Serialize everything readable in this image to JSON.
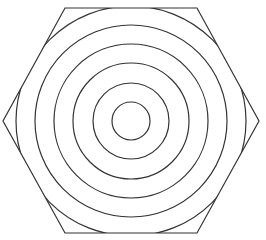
{
  "figure": {
    "width": 266,
    "height": 240,
    "background": "#ffffff",
    "stroke_color": "#333333",
    "stroke_width": 1.2,
    "hexagon": {
      "points": [
        [
          65,
          8
        ],
        [
          197,
          8
        ],
        [
          259,
          121
        ],
        [
          197,
          233
        ],
        [
          65,
          233
        ],
        [
          3,
          121
        ]
      ]
    },
    "circles": {
      "center": [
        131,
        121
      ],
      "radii": [
        19,
        38,
        58,
        77,
        96,
        115
      ]
    }
  }
}
